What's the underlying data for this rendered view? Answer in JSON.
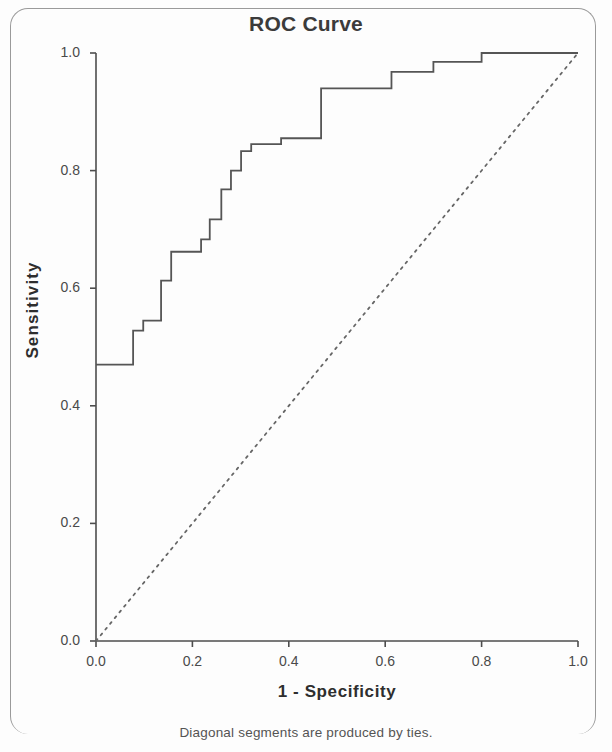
{
  "chart_data": {
    "type": "line",
    "title": "ROC Curve",
    "xlabel": "1 - Specificity",
    "ylabel": "Sensitivity",
    "footnote": "Diagonal segments are produced by ties.",
    "xlim": [
      0.0,
      1.0
    ],
    "ylim": [
      0.0,
      1.0
    ],
    "grid": false,
    "legend": "none",
    "xticks": [
      "0.0",
      "0.2",
      "0.4",
      "0.6",
      "0.8",
      "1.0"
    ],
    "xtick_values": [
      0.0,
      0.2,
      0.4,
      0.6,
      0.8,
      1.0
    ],
    "yticks": [
      "0.0",
      "0.2",
      "0.4",
      "0.6",
      "0.8",
      "1.0"
    ],
    "ytick_values": [
      0.0,
      0.2,
      0.4,
      0.6,
      0.8,
      1.0
    ],
    "series": [
      {
        "name": "ROC curve",
        "style": "solid",
        "color": "#555555",
        "x": [
          0.0,
          0.077,
          0.077,
          0.098,
          0.098,
          0.135,
          0.135,
          0.156,
          0.156,
          0.218,
          0.218,
          0.236,
          0.236,
          0.26,
          0.26,
          0.28,
          0.28,
          0.301,
          0.301,
          0.322,
          0.322,
          0.384,
          0.384,
          0.405,
          0.405,
          0.467,
          0.467,
          0.613,
          0.613,
          0.7,
          0.7,
          0.8,
          0.8,
          1.0
        ],
        "y": [
          0.47,
          0.47,
          0.528,
          0.528,
          0.545,
          0.545,
          0.613,
          0.613,
          0.662,
          0.662,
          0.683,
          0.683,
          0.717,
          0.717,
          0.768,
          0.768,
          0.8,
          0.8,
          0.833,
          0.833,
          0.845,
          0.845,
          0.855,
          0.855,
          0.855,
          0.855,
          0.94,
          0.94,
          0.968,
          0.968,
          0.985,
          0.985,
          1.0,
          1.0
        ]
      },
      {
        "name": "Reference line",
        "style": "dotted",
        "color": "#666666",
        "x": [
          0.0,
          1.0
        ],
        "y": [
          0.0,
          1.0
        ]
      }
    ]
  },
  "axes": {
    "plot_left_px": 96,
    "plot_right_px": 578,
    "plot_top_px": 53,
    "plot_bottom_px": 641
  }
}
